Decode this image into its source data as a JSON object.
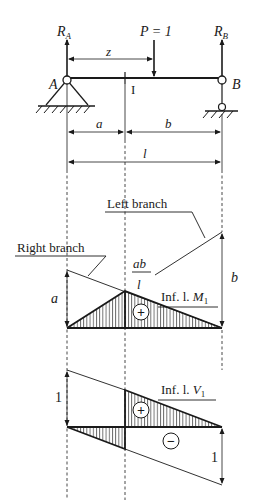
{
  "beam": {
    "support_left_label": "A",
    "support_right_label": "B",
    "reaction_left": "R",
    "reaction_left_sub": "A",
    "reaction_right": "R",
    "reaction_right_sub": "B",
    "load_label": "P = 1",
    "position_label": "z",
    "section_label": "I"
  },
  "dimensions": {
    "a": "a",
    "b": "b",
    "l": "l"
  },
  "moment_line": {
    "left_branch_label": "Left branch",
    "right_branch_label": "Right branch",
    "ordinate_a": "a",
    "ordinate_b": "b",
    "peak_num": "ab",
    "peak_den": "l",
    "title_prefix": "Inf. l. ",
    "title_var": "M",
    "title_sub": "1",
    "sign": "+"
  },
  "shear_line": {
    "ordinate_left": "1",
    "ordinate_right": "1",
    "title_prefix": "Inf. l. ",
    "title_var": "V",
    "title_sub": "1",
    "sign_plus": "+",
    "sign_minus": "−"
  },
  "colors": {
    "ink": "#1a1a1a",
    "background": "#ffffff"
  }
}
